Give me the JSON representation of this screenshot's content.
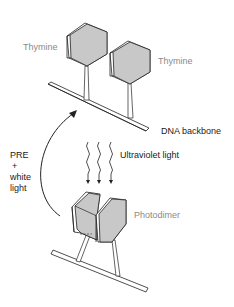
{
  "diagram": {
    "labels": {
      "thymine_left": "Thymine",
      "thymine_right": "Thymine",
      "dna_backbone": "DNA backbone",
      "ultraviolet": "Ultraviolet light",
      "photodimer": "Photodimer",
      "pre_line1": "PRE",
      "pre_line2": "+",
      "pre_line3": "white",
      "pre_line4": "light"
    },
    "colors": {
      "base_fill": "#c8c8c8",
      "stroke": "#222222",
      "label_gray": "#8a8a8a",
      "label_dark": "#1a1a1a"
    }
  }
}
